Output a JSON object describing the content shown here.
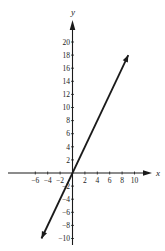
{
  "chart_data": {
    "type": "line",
    "title": "",
    "xlabel": "x",
    "ylabel": "y",
    "xlim": [
      -10,
      12
    ],
    "ylim": [
      -10,
      22
    ],
    "grid": false,
    "x_ticks": [
      -6,
      -4,
      -2,
      2,
      4,
      6,
      8,
      10
    ],
    "x_tick_labels": [
      "−6",
      "−4",
      "−2",
      "2",
      "4",
      "6",
      "8",
      "10"
    ],
    "y_ticks": [
      20,
      18,
      16,
      14,
      12,
      10,
      8,
      6,
      4,
      2,
      -2,
      -4,
      -6,
      -8,
      -10
    ],
    "y_tick_labels": [
      "20",
      "18",
      "16",
      "14",
      "12",
      "10",
      "8",
      "6",
      "4",
      "2",
      "−2",
      "−4",
      "−6",
      "−8",
      "−10"
    ],
    "series": [
      {
        "name": "y = 2x",
        "equation": "y = 2x",
        "x": [
          -5,
          9
        ],
        "values": [
          -10,
          18
        ],
        "arrows_both_ends": true,
        "color": "#1a1a1a"
      }
    ],
    "axis_color": "#1a1a1a"
  }
}
